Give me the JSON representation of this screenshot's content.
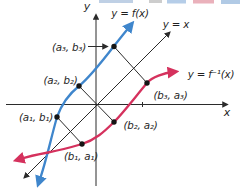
{
  "colors": {
    "curve_f": "#3f86cc",
    "curve_f_inverse": "#d5315d",
    "line": "#2b2b2b",
    "point": "#151515"
  },
  "axes": {
    "x_label": "x",
    "y_label": "y"
  },
  "curves": {
    "f": "y = f(x)",
    "identity": "y = x",
    "f_inverse": "y = f⁻¹(x)"
  },
  "points": {
    "on_f": [
      "(a₁, b₁)",
      "(a₂, b₂)",
      "(a₃, b₃)"
    ],
    "on_f_inverse": [
      "(b₁, a₁)",
      "(b₂, a₂)",
      "(b₃, a₃)"
    ]
  }
}
